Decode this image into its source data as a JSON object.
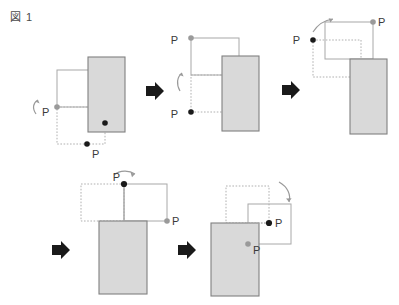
{
  "figure": {
    "caption": "図 1",
    "caption_number": "1",
    "title_text": "図 1"
  },
  "colors": {
    "panel_fill": "#d9d9d9",
    "panel_stroke": "#808080",
    "outline_stroke": "#a8a8a8",
    "dotted_stroke": "#b0b0b0",
    "marker_dark": "#1a1a1a",
    "marker_light": "#9a9a9a",
    "rotation_arrow": "#9a9a9a",
    "step_arrow": "#1a1a1a",
    "label_text": "#3a3a3a",
    "background": "#ffffff"
  },
  "steps": [
    {
      "id": "step-1",
      "index": "1",
      "labels": [
        {
          "name": "pivot-label-left",
          "text": "P",
          "x": 42,
          "y": 116,
          "marker": "light"
        },
        {
          "name": "pivot-label-bottom",
          "text": "P",
          "x": 92,
          "y": 158,
          "marker": "dark"
        }
      ],
      "rotation_direction": "counter-clockwise-up"
    },
    {
      "id": "step-2",
      "index": "2",
      "labels": [
        {
          "name": "pivot-label-top",
          "text": "P",
          "x": 178,
          "y": 44,
          "marker": "light"
        },
        {
          "name": "pivot-label-bottom",
          "text": "P",
          "x": 178,
          "y": 120,
          "marker": "dark"
        }
      ],
      "rotation_direction": "counter-clockwise-up"
    },
    {
      "id": "step-3",
      "index": "3",
      "labels": [
        {
          "name": "pivot-label-right",
          "text": "P",
          "x": 378,
          "y": 22,
          "marker": "light"
        },
        {
          "name": "pivot-label-left",
          "text": "P",
          "x": 302,
          "y": 44,
          "marker": "dark"
        }
      ],
      "rotation_direction": "clockwise-up-right"
    },
    {
      "id": "step-4",
      "index": "4",
      "labels": [
        {
          "name": "pivot-label-top",
          "text": "P",
          "x": 120,
          "y": 180,
          "marker": "dark"
        },
        {
          "name": "pivot-label-right",
          "text": "P",
          "x": 168,
          "y": 222,
          "marker": "light"
        }
      ],
      "rotation_direction": "clockwise-over-top"
    },
    {
      "id": "step-5",
      "index": "5",
      "labels": [
        {
          "name": "pivot-label-inner",
          "text": "P",
          "x": 268,
          "y": 224,
          "marker": "dark"
        },
        {
          "name": "pivot-label-lower",
          "text": "P",
          "x": 250,
          "y": 248,
          "marker": "light"
        }
      ],
      "rotation_direction": "clockwise-down"
    }
  ],
  "step_arrows": [
    {
      "name": "step-arrow-1-to-2",
      "from": "step-1",
      "to": "step-2",
      "x": 152,
      "y": 93
    },
    {
      "name": "step-arrow-2-to-3",
      "from": "step-2",
      "to": "step-3",
      "x": 288,
      "y": 92
    },
    {
      "name": "step-arrow-3-to-4",
      "from": "step-3",
      "to": "step-4",
      "x": 58,
      "y": 252
    },
    {
      "name": "step-arrow-4-to-5",
      "from": "step-4",
      "to": "step-5",
      "x": 184,
      "y": 252
    }
  ]
}
